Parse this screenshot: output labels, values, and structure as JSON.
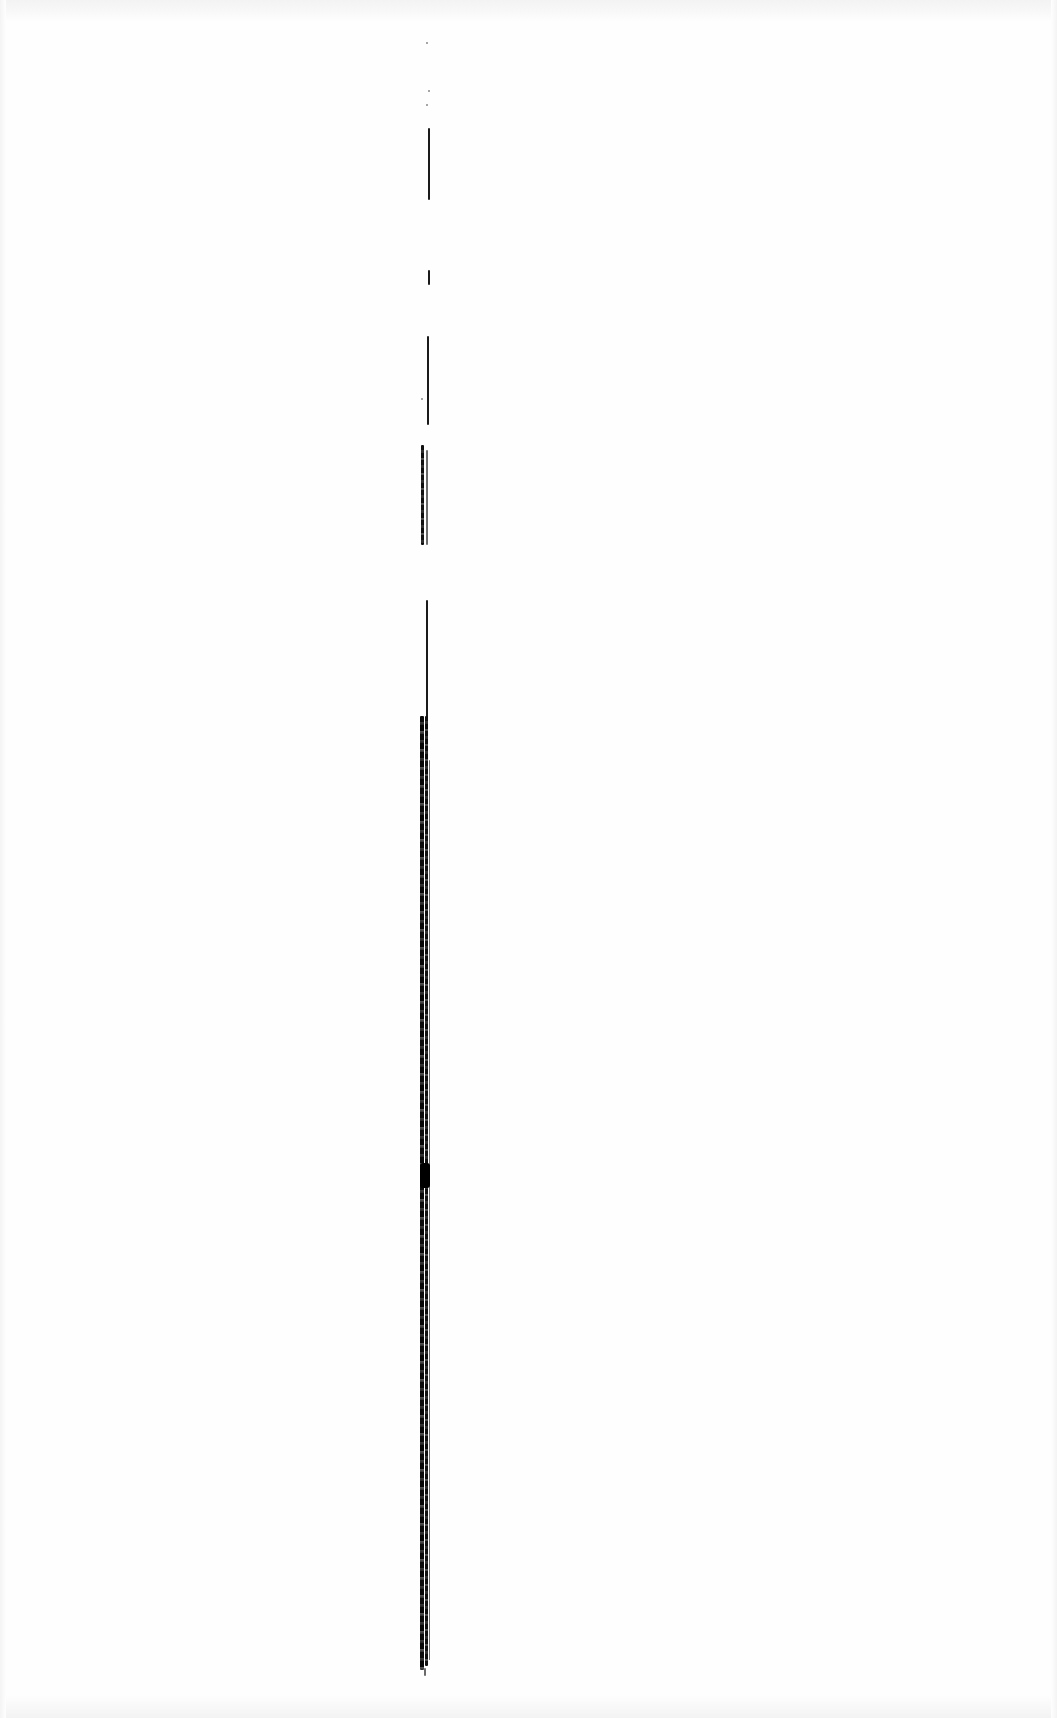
{
  "document": {
    "type": "scanned-page",
    "background_color": "#fefefe",
    "text_content": "",
    "mark": {
      "description": "vertical gutter/binding line",
      "color": "#111111",
      "x": 425,
      "segments": [
        {
          "top": 128,
          "bottom": 200,
          "style": "thin"
        },
        {
          "top": 270,
          "bottom": 285,
          "style": "thin"
        },
        {
          "top": 336,
          "bottom": 425,
          "style": "thin"
        },
        {
          "top": 445,
          "bottom": 545,
          "style": "rough"
        },
        {
          "top": 600,
          "bottom": 720,
          "style": "thin"
        },
        {
          "top": 720,
          "bottom": 1670,
          "style": "thick"
        }
      ],
      "blob": {
        "top": 1163,
        "bottom": 1188
      }
    }
  }
}
